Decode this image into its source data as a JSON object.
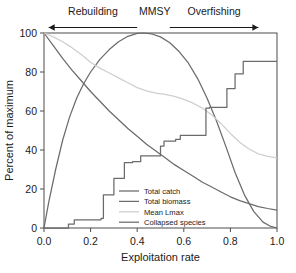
{
  "chart_data": {
    "type": "line",
    "title": "",
    "xlabel": "Exploitation rate",
    "ylabel": "Percent of maximum",
    "xlim": [
      0.0,
      1.0
    ],
    "ylim": [
      0,
      100
    ],
    "grid": false,
    "legend_position": "inside-lower-center",
    "xticks": [
      "0.0",
      "0.2",
      "0.4",
      "0.6",
      "0.8",
      "1.0"
    ],
    "xtick_values": [
      0.0,
      0.2,
      0.4,
      0.6,
      0.8,
      1.0
    ],
    "yticks": [
      "0",
      "20",
      "40",
      "60",
      "80",
      "100"
    ],
    "ytick_values": [
      0,
      20,
      40,
      60,
      80,
      100
    ],
    "annotations": [
      {
        "name": "rebuilding",
        "text": "Rebuilding",
        "arrow": "left",
        "x_start": 0.02,
        "x_end": 0.4
      },
      {
        "name": "mmsy",
        "text": "MMSY",
        "arrow": "none",
        "x_start": 0.43,
        "x_end": 0.52
      },
      {
        "name": "overfishing",
        "text": "Overfishing",
        "arrow": "right",
        "x_start": 0.54,
        "x_end": 0.92
      }
    ],
    "series": [
      {
        "name": "Total catch",
        "color": "#6b6b6b",
        "x": [
          0.0,
          0.02,
          0.05,
          0.08,
          0.11,
          0.14,
          0.17,
          0.2,
          0.24,
          0.28,
          0.32,
          0.36,
          0.4,
          0.43,
          0.46,
          0.5,
          0.54,
          0.58,
          0.62,
          0.66,
          0.7,
          0.74,
          0.78,
          0.82,
          0.86,
          0.9,
          0.94,
          0.97,
          1.0
        ],
        "y": [
          0.0,
          13.0,
          30.0,
          45.0,
          57.0,
          66.5,
          74.0,
          80.0,
          86.5,
          91.5,
          95.5,
          98.3,
          99.8,
          100.0,
          99.6,
          98.0,
          95.0,
          90.5,
          84.5,
          76.5,
          66.5,
          55.0,
          42.0,
          28.5,
          17.0,
          8.5,
          3.0,
          1.0,
          0.0
        ]
      },
      {
        "name": "Total biomass",
        "color": "#6b6b6b",
        "x": [
          0.0,
          0.04,
          0.08,
          0.12,
          0.16,
          0.2,
          0.24,
          0.28,
          0.32,
          0.36,
          0.4,
          0.44,
          0.48,
          0.52,
          0.56,
          0.6,
          0.64,
          0.68,
          0.72,
          0.76,
          0.8,
          0.84,
          0.88,
          0.92,
          0.96,
          1.0
        ],
        "y": [
          100.0,
          93.5,
          87.0,
          81.0,
          75.5,
          70.0,
          65.0,
          60.0,
          55.5,
          51.0,
          47.0,
          43.0,
          39.5,
          36.0,
          32.5,
          29.5,
          26.5,
          23.5,
          21.0,
          18.5,
          16.0,
          14.0,
          12.5,
          11.0,
          10.0,
          9.2
        ]
      },
      {
        "name": "Mean Lmax",
        "color": "#cfcfcf",
        "x": [
          0.0,
          0.04,
          0.08,
          0.12,
          0.16,
          0.2,
          0.24,
          0.28,
          0.32,
          0.36,
          0.4,
          0.44,
          0.48,
          0.52,
          0.56,
          0.6,
          0.64,
          0.68,
          0.72,
          0.76,
          0.8,
          0.84,
          0.88,
          0.92,
          0.96,
          1.0
        ],
        "y": [
          100.0,
          98.0,
          95.5,
          92.5,
          89.0,
          85.0,
          82.0,
          79.5,
          77.0,
          74.5,
          72.0,
          70.3,
          69.2,
          68.5,
          67.5,
          66.0,
          64.0,
          61.5,
          58.0,
          53.5,
          48.5,
          44.0,
          40.5,
          38.0,
          36.7,
          36.0
        ]
      },
      {
        "name": "Collapsed species",
        "color": "#6b6b6b",
        "step": true,
        "x": [
          0.0,
          0.105,
          0.105,
          0.13,
          0.13,
          0.245,
          0.245,
          0.255,
          0.255,
          0.3,
          0.3,
          0.345,
          0.345,
          0.38,
          0.38,
          0.415,
          0.415,
          0.5,
          0.5,
          0.515,
          0.515,
          0.565,
          0.565,
          0.585,
          0.585,
          0.695,
          0.695,
          0.71,
          0.71,
          0.785,
          0.785,
          0.82,
          0.82,
          0.855,
          0.855,
          1.0
        ],
        "y": [
          0.0,
          0.0,
          2.0,
          2.0,
          4.2,
          4.2,
          5.0,
          5.0,
          17.0,
          17.0,
          25.5,
          25.5,
          33.5,
          33.5,
          34.0,
          34.0,
          37.0,
          37.0,
          42.0,
          42.0,
          44.5,
          44.5,
          45.5,
          45.5,
          47.5,
          47.5,
          61.5,
          61.5,
          61.8,
          61.8,
          71.5,
          71.5,
          79.0,
          79.0,
          85.5,
          85.5
        ]
      }
    ],
    "legend": [
      {
        "label": "Total catch",
        "color": "#6b6b6b"
      },
      {
        "label": "Total biomass",
        "color": "#6b6b6b"
      },
      {
        "label": "Mean Lmax",
        "color": "#cfcfcf"
      },
      {
        "label": "Collapsed species",
        "color": "#6b6b6b"
      }
    ]
  }
}
